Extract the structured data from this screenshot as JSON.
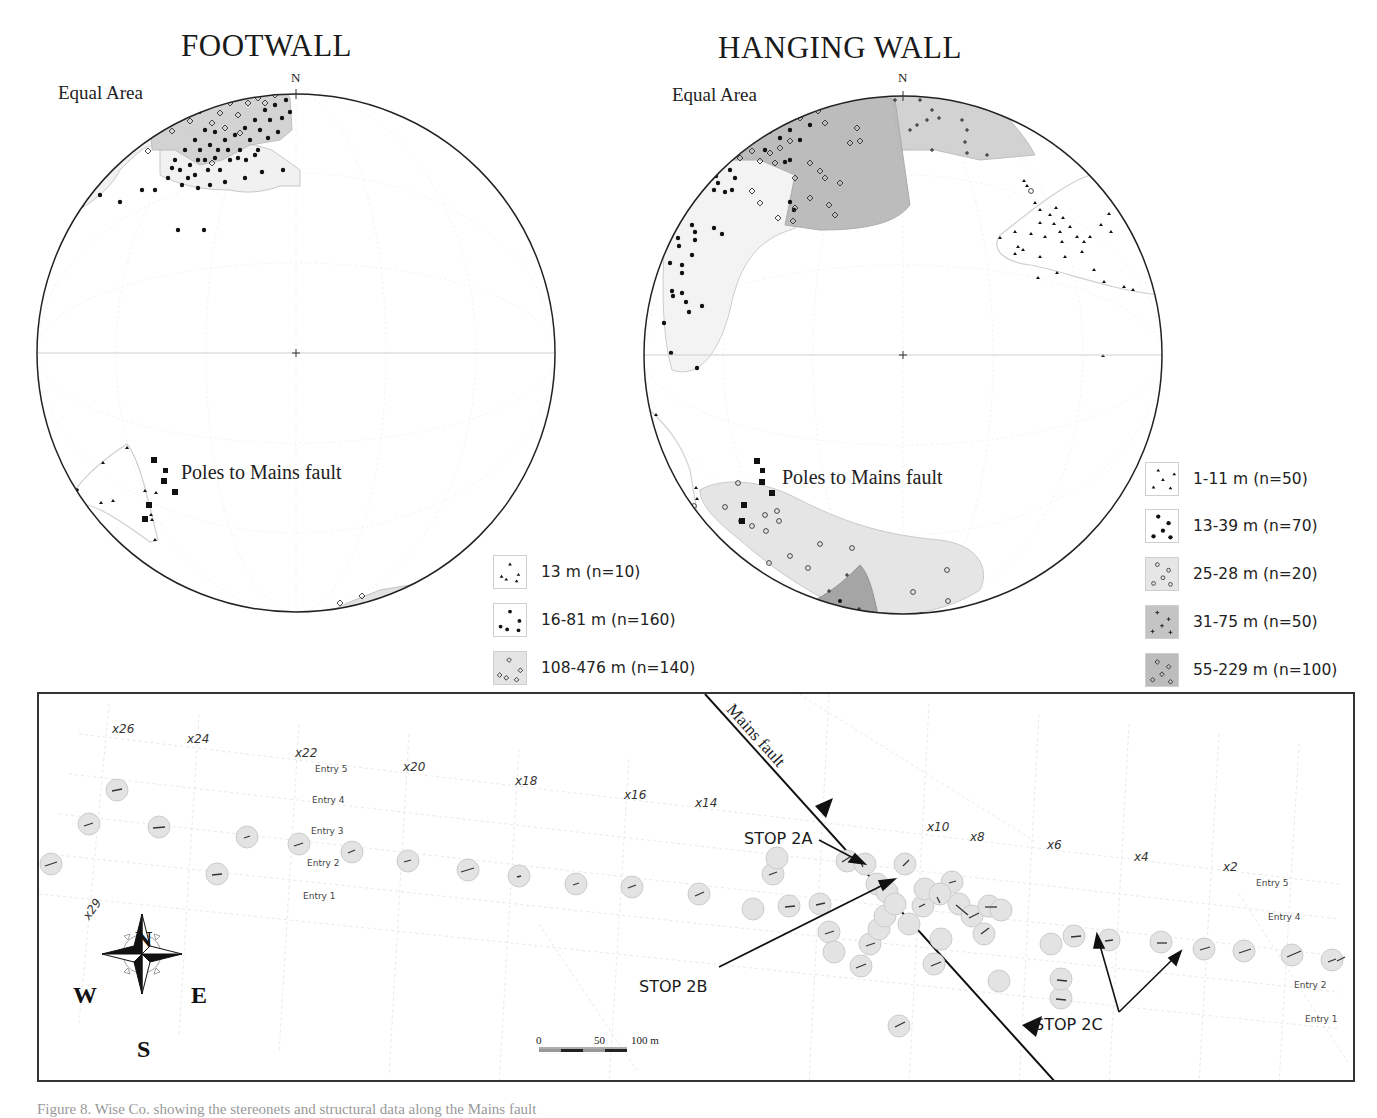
{
  "footwall": {
    "title": "FOOTWALL",
    "projection_label": "Equal Area",
    "north_label": "N",
    "poles_label": "Poles to Mains fault",
    "legend": [
      {
        "symbol": "triangle",
        "fill": "#ffffff",
        "label": "13 m (n=10)"
      },
      {
        "symbol": "dot",
        "fill": "#ffffff",
        "label": "16-81 m (n=160)"
      },
      {
        "symbol": "diamond",
        "fill": "#e4e4e4",
        "label": "108-476 m (n=140)"
      }
    ]
  },
  "hanging_wall": {
    "title": "HANGING WALL",
    "projection_label": "Equal Area",
    "north_label": "N",
    "poles_label": "Poles to Mains fault",
    "legend": [
      {
        "symbol": "triangle",
        "fill": "#ffffff",
        "label": "1-11 m (n=50)"
      },
      {
        "symbol": "dot",
        "fill": "#ffffff",
        "label": "13-39 m (n=70)"
      },
      {
        "symbol": "circle",
        "fill": "#e6e6e6",
        "label": "25-28 m (n=20)"
      },
      {
        "symbol": "plus",
        "fill": "#c4c4c4",
        "label": "31-75 m (n=50)"
      },
      {
        "symbol": "diamond",
        "fill": "#bcbcbc",
        "label": "55-229 m (n=100)"
      }
    ]
  },
  "map": {
    "fault_label": "Mains fault",
    "crosscuts": [
      {
        "label": "x26",
        "x": 75,
        "y": 28
      },
      {
        "label": "x24",
        "x": 150,
        "y": 38
      },
      {
        "label": "x22",
        "x": 258,
        "y": 52
      },
      {
        "label": "x20",
        "x": 366,
        "y": 66
      },
      {
        "label": "x18",
        "x": 478,
        "y": 80
      },
      {
        "label": "x16",
        "x": 587,
        "y": 94
      },
      {
        "label": "x14",
        "x": 658,
        "y": 102
      },
      {
        "label": "x10",
        "x": 890,
        "y": 128
      },
      {
        "label": "x8",
        "x": 933,
        "y": 138
      },
      {
        "label": "x6",
        "x": 1010,
        "y": 146
      },
      {
        "label": "x4",
        "x": 1097,
        "y": 158
      },
      {
        "label": "x2",
        "x": 1186,
        "y": 168
      }
    ],
    "crosscut_rotated": {
      "label": "x29",
      "x": 46,
      "y": 212
    },
    "entries_west": [
      {
        "label": "Entry 5",
        "x": 276,
        "y": 71
      },
      {
        "label": "Entry 4",
        "x": 273,
        "y": 102
      },
      {
        "label": "Entry 3",
        "x": 272,
        "y": 140
      },
      {
        "label": "Entry 2",
        "x": 268,
        "y": 172
      },
      {
        "label": "Entry 1",
        "x": 264,
        "y": 206
      }
    ],
    "entries_east": [
      {
        "label": "Entry 5",
        "x": 1218,
        "y": 183
      },
      {
        "label": "Entry 4",
        "x": 1230,
        "y": 218
      },
      {
        "label": "Entry 2",
        "x": 1256,
        "y": 286
      },
      {
        "label": "Entry 1",
        "x": 1266,
        "y": 320
      }
    ],
    "stops": [
      {
        "label": "STOP 2A",
        "x": 705,
        "y": 136
      },
      {
        "label": "STOP 2B",
        "x": 600,
        "y": 283
      },
      {
        "label": "STOP 2C",
        "x": 996,
        "y": 322
      }
    ],
    "compass": {
      "n": "N",
      "s": "S",
      "e": "E",
      "w": "W"
    },
    "scale": {
      "zero": "0",
      "mid": "50",
      "end": "100 m"
    }
  },
  "caption": "Figure 8. Wise Co. showing the stereonets and structural data along the Mains fault"
}
